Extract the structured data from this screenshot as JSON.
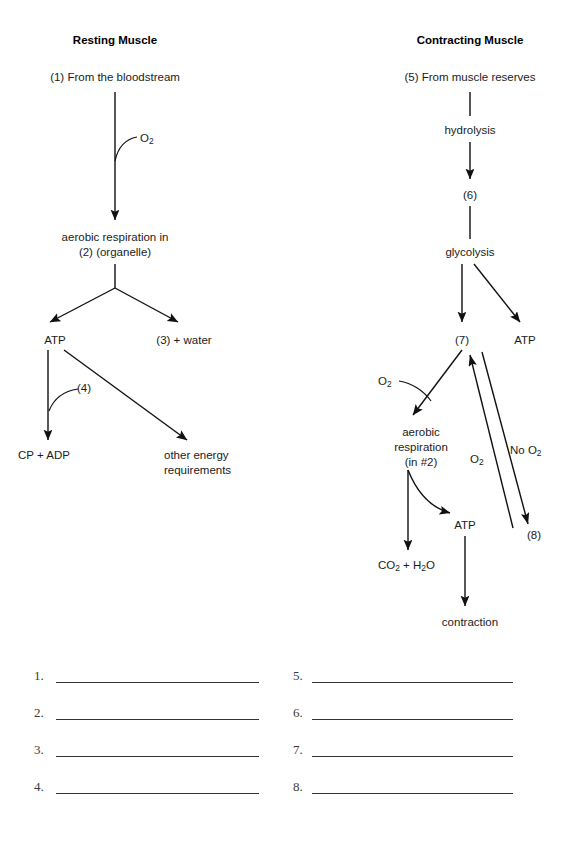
{
  "page": {
    "width": 576,
    "height": 842,
    "background": "#ffffff",
    "ink": "#1a1a1a"
  },
  "columns": {
    "left": {
      "heading": "Resting Muscle"
    },
    "right": {
      "heading": "Contracting Muscle"
    }
  },
  "diagram": {
    "left_flow": {
      "source": "(1) From the bloodstream",
      "input_label": "O2",
      "process_line1": "aerobic respiration in",
      "process_line2": "(2) (organelle)",
      "product_atp": "ATP",
      "product_blank": "(3) + water",
      "branch_label": "(4)",
      "output_cp_adp": "CP + ADP",
      "output_other_line1": "other energy",
      "output_other_line2": "requirements"
    },
    "right_flow": {
      "source": "(5) From muscle reserves",
      "step_hydrolysis": "hydrolysis",
      "intermediate_6": "(6)",
      "step_glycolysis": "glycolysis",
      "product_7": "(7)",
      "product_atp": "ATP",
      "oxygen_in": "O2",
      "aerobic_line1": "aerobic",
      "aerobic_line2": "respiration",
      "aerobic_line3": "(in #2)",
      "no_oxygen_label": "No O2",
      "oxygen_return_label": "O2",
      "product_8": "(8)",
      "waste": "CO2 + H2O",
      "atp_out": "ATP",
      "final": "contraction"
    }
  },
  "answers": {
    "left_column": [
      "1.",
      "2.",
      "3.",
      "4."
    ],
    "right_column": [
      "5.",
      "6.",
      "7.",
      "8."
    ]
  }
}
